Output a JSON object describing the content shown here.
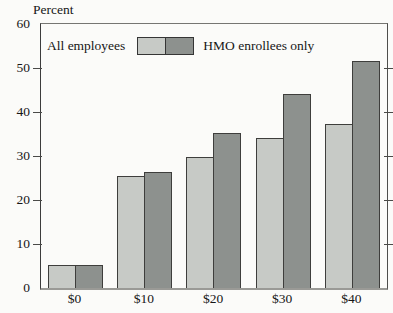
{
  "figure_title": "",
  "chart_data": {
    "type": "bar",
    "title": "",
    "ylabel": "Percent",
    "xlabel": "",
    "categories": [
      "$0",
      "$10",
      "$20",
      "$30",
      "$40"
    ],
    "series": [
      {
        "name": "All employees",
        "color": "#c7cac6",
        "values": [
          5.3,
          25.4,
          29.8,
          34.0,
          37.2
        ]
      },
      {
        "name": "HMO enrollees only",
        "color": "#8d918e",
        "values": [
          5.3,
          26.4,
          35.2,
          44.2,
          51.6
        ]
      }
    ],
    "ylim": [
      0,
      60
    ],
    "yticks": [
      0,
      10,
      20,
      30,
      40,
      50,
      60
    ],
    "grid": false,
    "legend_position": "top-inside",
    "frame": "full-box",
    "tick_sides": [
      "left",
      "right"
    ]
  },
  "colors": {
    "background": "#fbfbf9",
    "bar_outline": "#3e3e3c",
    "text": "#161616",
    "baseline": "#9a9a96"
  }
}
